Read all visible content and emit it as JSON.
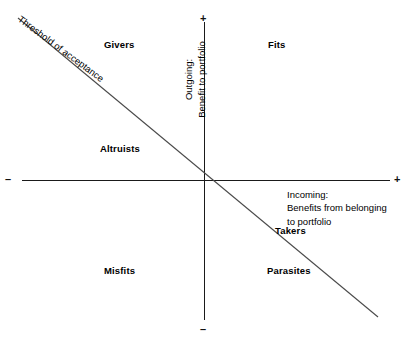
{
  "diagram": {
    "type": "two-axis-quadrant-matrix",
    "axes": {
      "x": {
        "caption_lines": [
          "Incoming:",
          "Benefits from belonging",
          "to portfolio"
        ],
        "negative_sign": "–",
        "positive_sign": "+"
      },
      "y": {
        "caption_lines": [
          "Outgoing:",
          "Benefit to  portfolio"
        ],
        "negative_sign": "–",
        "positive_sign": "+"
      }
    },
    "threshold_line": {
      "label": "Threshold of acceptance"
    },
    "quadrant_labels": {
      "top_left": "Givers",
      "top_right": "Fits",
      "middle_left": "Altruists",
      "middle_right": "Takers",
      "bottom_left": "Misfits",
      "bottom_right": "Parasites"
    },
    "colors": {
      "line": "#1a1a1a",
      "text": "#000000",
      "background": "#ffffff"
    }
  }
}
